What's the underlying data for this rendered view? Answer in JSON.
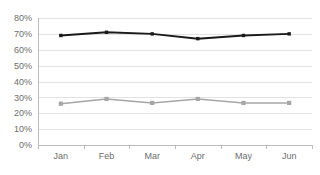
{
  "chart_data": {
    "type": "line",
    "title": "",
    "subtitle": "",
    "xlabel": "",
    "ylabel": "",
    "categories": [
      "Jan",
      "Feb",
      "Mar",
      "Apr",
      "May",
      "Jun"
    ],
    "series": [
      {
        "name": "dark-series",
        "color": "#1a1a1a",
        "values": [
          69,
          71,
          70,
          67,
          69,
          70
        ],
        "marker": "square"
      },
      {
        "name": "gray-series",
        "color": "#a6a6a6",
        "values": [
          26,
          29,
          26.5,
          29,
          26.5,
          26.5
        ],
        "marker": "square"
      }
    ],
    "ylim": [
      0,
      80
    ],
    "y_ticks": [
      0,
      10,
      20,
      30,
      40,
      50,
      60,
      70,
      80
    ],
    "y_tick_labels": [
      "0%",
      "10%",
      "20%",
      "30%",
      "40%",
      "50%",
      "60%",
      "70%",
      "80%"
    ],
    "grid": true,
    "grid_axis": "y",
    "legend": false,
    "legend_position": "none",
    "axis_color": "#bdbdbd",
    "grid_color": "#e2e2e2",
    "tick_label_color": "#6d6d6d",
    "background_color": "#ffffff"
  },
  "plot_geometry": {
    "left": 38,
    "right": 312,
    "top": 18,
    "bottom": 145
  }
}
